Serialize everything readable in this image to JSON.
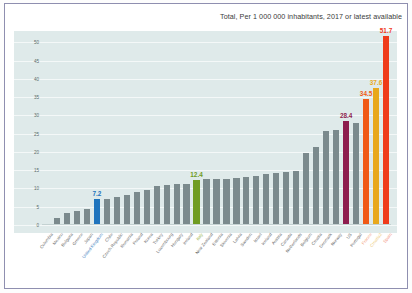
{
  "chart_title": "Total, Per 1 000 000 inhabitants, 2017 or latest available",
  "axis": {
    "yticks": [
      "0",
      "5",
      "10",
      "15",
      "20",
      "25",
      "30",
      "35",
      "40",
      "45",
      "50"
    ],
    "ylabel": "",
    "xlabel": ""
  },
  "colors": {
    "plot_background": "#dfeaea",
    "gridline": "#f4f8f8",
    "default_bar": "#7b8a8d",
    "blue": "#1f74bd",
    "green": "#6f9c22",
    "magenta": "#8e1d4e",
    "orange": "#f05a16",
    "gold": "#e8a81c",
    "red": "#ef3b1b",
    "frame": "#8f8fb0",
    "title_text": "#3b3b3b",
    "tick_text": "#5a6a6a",
    "label_text": "#6b6b6b"
  },
  "chart_data": {
    "type": "bar",
    "title": "Total, Per 1 000 000 inhabitants, 2017 or latest available",
    "xlabel": "",
    "ylabel": "",
    "ylim": [
      0,
      52
    ],
    "yticks": [
      0,
      5,
      10,
      15,
      20,
      25,
      30,
      35,
      40,
      45,
      50
    ],
    "grid": true,
    "legend": "none",
    "categories": [
      "Colombia",
      "Mexico",
      "Bulgaria",
      "Greece",
      "Japan",
      "United Kingdom",
      "Chile",
      "Czech Republic",
      "Romania",
      "Poland",
      "Korea",
      "Turkey",
      "Luxembourg",
      "Hungary",
      "Ireland",
      "Italy",
      "Estonia",
      "New Zealand",
      "Slovenia",
      "Spain",
      "Latvia",
      "Belgium",
      "Sweden",
      "Israel",
      "Iceland",
      "Austria",
      "Canada",
      "Finland",
      "Denmark",
      "Slovakia",
      "Portugal",
      "France",
      "Norway",
      "Switzerland",
      "Australia"
    ],
    "values": [
      0.3,
      1.8,
      3.3,
      3.9,
      4.5,
      7.2,
      7.0,
      7.8,
      8.2,
      9.0,
      9.6,
      10.7,
      10.9,
      11.2,
      11.2,
      12.4,
      12.7,
      12.7,
      12.7,
      13.2,
      14.0,
      14.2,
      14.8,
      19.6,
      21.3,
      25.7,
      25.9,
      28.4,
      27.8,
      34.5,
      37.6,
      51.7,
      12.9,
      13.4,
      14.4
    ],
    "highlighted": [
      {
        "category": "United Kingdom",
        "value": 7.2,
        "color": "#1f74bd",
        "label": "7.2"
      },
      {
        "category": "Italy",
        "value": 12.4,
        "color": "#6f9c22",
        "label": "12.4"
      },
      {
        "category": "Finland",
        "value": 28.4,
        "color": "#8e1d4e",
        "label": "28.4"
      },
      {
        "category": "Slovakia",
        "value": 34.5,
        "color": "#f05a16",
        "label": "34.5"
      },
      {
        "category": "Portugal",
        "value": 37.6,
        "color": "#e8a81c",
        "label": "37.6"
      },
      {
        "category": "France",
        "value": 51.7,
        "color": "#ef3b1b",
        "label": "51.7"
      }
    ]
  },
  "bars": [
    {
      "label": "Colombia",
      "value": 0.3,
      "color": "#7b8a8d",
      "label_color": "#6b6b6b",
      "value_label": null
    },
    {
      "label": "Mexico",
      "value": 1.8,
      "color": "#7b8a8d",
      "label_color": "#6b6b6b",
      "value_label": null
    },
    {
      "label": "Bulgaria",
      "value": 3.3,
      "color": "#7b8a8d",
      "label_color": "#6b6b6b",
      "value_label": null
    },
    {
      "label": "Greece",
      "value": 3.9,
      "color": "#7b8a8d",
      "label_color": "#6b6b6b",
      "value_label": null
    },
    {
      "label": "Japan",
      "value": 4.5,
      "color": "#7b8a8d",
      "label_color": "#6b6b6b",
      "value_label": null
    },
    {
      "label": "United Kingdom",
      "value": 7.2,
      "color": "#1f74bd",
      "label_color": "#3f7fc0",
      "value_label": "7.2"
    },
    {
      "label": "Chile",
      "value": 7.0,
      "color": "#7b8a8d",
      "label_color": "#6b6b6b",
      "value_label": null
    },
    {
      "label": "Czech Republic",
      "value": 7.8,
      "color": "#7b8a8d",
      "label_color": "#6b6b6b",
      "value_label": null
    },
    {
      "label": "Romania",
      "value": 8.2,
      "color": "#7b8a8d",
      "label_color": "#6b6b6b",
      "value_label": null
    },
    {
      "label": "Poland",
      "value": 9.0,
      "color": "#7b8a8d",
      "label_color": "#6b6b6b",
      "value_label": null
    },
    {
      "label": "Korea",
      "value": 9.6,
      "color": "#7b8a8d",
      "label_color": "#6b6b6b",
      "value_label": null
    },
    {
      "label": "Turkey",
      "value": 10.7,
      "color": "#7b8a8d",
      "label_color": "#6b6b6b",
      "value_label": null
    },
    {
      "label": "Luxembourg",
      "value": 10.9,
      "color": "#7b8a8d",
      "label_color": "#6b6b6b",
      "value_label": null
    },
    {
      "label": "Hungary",
      "value": 11.2,
      "color": "#7b8a8d",
      "label_color": "#6b6b6b",
      "value_label": null
    },
    {
      "label": "Ireland",
      "value": 11.2,
      "color": "#7b8a8d",
      "label_color": "#6b6b6b",
      "value_label": null
    },
    {
      "label": "Italy",
      "value": 12.4,
      "color": "#6f9c22",
      "label_color": "#8fae3a",
      "value_label": "12.4"
    },
    {
      "label": "New Zealand",
      "value": 12.7,
      "color": "#7b8a8d",
      "label_color": "#6b6b6b",
      "value_label": null
    },
    {
      "label": "Estonia",
      "value": 12.7,
      "color": "#7b8a8d",
      "label_color": "#6b6b6b",
      "value_label": null
    },
    {
      "label": "Slovenia",
      "value": 12.7,
      "color": "#7b8a8d",
      "label_color": "#6b6b6b",
      "value_label": null
    },
    {
      "label": "Latvia",
      "value": 12.9,
      "color": "#7b8a8d",
      "label_color": "#6b6b6b",
      "value_label": null
    },
    {
      "label": "Sweden",
      "value": 13.2,
      "color": "#7b8a8d",
      "label_color": "#6b6b6b",
      "value_label": null
    },
    {
      "label": "Israel",
      "value": 13.4,
      "color": "#7b8a8d",
      "label_color": "#6b6b6b",
      "value_label": null
    },
    {
      "label": "Iceland",
      "value": 14.0,
      "color": "#7b8a8d",
      "label_color": "#6b6b6b",
      "value_label": null
    },
    {
      "label": "Austria",
      "value": 14.2,
      "color": "#7b8a8d",
      "label_color": "#6b6b6b",
      "value_label": null
    },
    {
      "label": "Canada",
      "value": 14.4,
      "color": "#7b8a8d",
      "label_color": "#6b6b6b",
      "value_label": null
    },
    {
      "label": "Netherlands",
      "value": 14.8,
      "color": "#7b8a8d",
      "label_color": "#6b6b6b",
      "value_label": null
    },
    {
      "label": "Belgium",
      "value": 19.6,
      "color": "#7b8a8d",
      "label_color": "#6b6b6b",
      "value_label": null
    },
    {
      "label": "Croatia",
      "value": 21.3,
      "color": "#7b8a8d",
      "label_color": "#6b6b6b",
      "value_label": null
    },
    {
      "label": "Denmark",
      "value": 25.7,
      "color": "#7b8a8d",
      "label_color": "#6b6b6b",
      "value_label": null
    },
    {
      "label": "Norway",
      "value": 25.9,
      "color": "#7b8a8d",
      "label_color": "#6b6b6b",
      "value_label": null
    },
    {
      "label": "US",
      "value": 28.4,
      "color": "#8e1d4e",
      "label_color": "#6b6b6b",
      "value_label": "28.4"
    },
    {
      "label": "Portugal",
      "value": 27.8,
      "color": "#7b8a8d",
      "label_color": "#6b6b6b",
      "value_label": null
    },
    {
      "label": "France",
      "value": 34.5,
      "color": "#f05a16",
      "label_color": "#f3a07a",
      "value_label": "34.5"
    },
    {
      "label": "Croatia2",
      "value": 37.6,
      "color": "#e8a81c",
      "label_color": "#eecb7e",
      "value_label": "37.6"
    },
    {
      "label": "Spain",
      "value": 51.7,
      "color": "#ef3b1b",
      "label_color": "#f3907c",
      "value_label": "51.7"
    }
  ]
}
